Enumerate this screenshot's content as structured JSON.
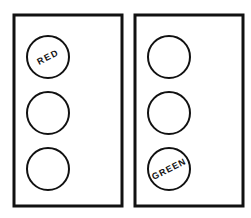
{
  "diagram": {
    "title": "Traffic Light Signal Faces",
    "background_color": "#ffffff",
    "stroke_color": "#111111",
    "fill_color": "#ffffff",
    "label_color": "#111111",
    "canvas": {
      "width": 251,
      "height": 218
    },
    "panels": [
      {
        "id": "left-signal-housing",
        "name": "left-traffic-light-housing",
        "x": 14,
        "y": 15,
        "width": 108,
        "height": 191,
        "stroke_width": 3,
        "lamps": [
          {
            "id": "left-lamp-top",
            "name": "lamp-red",
            "cx": 48,
            "cy": 57,
            "r": 21,
            "stroke_width": 2,
            "label": "RED",
            "label_rotation": -27,
            "label_font_size": 9,
            "label_letter_spacing": 1.4,
            "has_label": true
          },
          {
            "id": "left-lamp-middle",
            "name": "lamp-amber",
            "cx": 48,
            "cy": 113,
            "r": 21,
            "stroke_width": 2,
            "label": "",
            "label_rotation": 0,
            "label_font_size": 9,
            "label_letter_spacing": 1.4,
            "has_label": false
          },
          {
            "id": "left-lamp-bottom",
            "name": "lamp-green",
            "cx": 48,
            "cy": 169,
            "r": 21,
            "stroke_width": 2,
            "label": "",
            "label_rotation": 0,
            "label_font_size": 9,
            "label_letter_spacing": 1.4,
            "has_label": false
          }
        ]
      },
      {
        "id": "right-signal-housing",
        "name": "right-traffic-light-housing",
        "x": 135,
        "y": 15,
        "width": 108,
        "height": 191,
        "stroke_width": 3,
        "lamps": [
          {
            "id": "right-lamp-top",
            "name": "lamp-red",
            "cx": 169,
            "cy": 57,
            "r": 21,
            "stroke_width": 2,
            "label": "",
            "label_rotation": 0,
            "label_font_size": 9,
            "label_letter_spacing": 1.4,
            "has_label": false
          },
          {
            "id": "right-lamp-middle",
            "name": "lamp-amber",
            "cx": 169,
            "cy": 113,
            "r": 21,
            "stroke_width": 2,
            "label": "",
            "label_rotation": 0,
            "label_font_size": 9,
            "label_letter_spacing": 1.4,
            "has_label": false
          },
          {
            "id": "right-lamp-bottom",
            "name": "lamp-green",
            "cx": 169,
            "cy": 169,
            "r": 21,
            "stroke_width": 2,
            "label": "GREEN",
            "label_rotation": -27,
            "label_font_size": 9,
            "label_letter_spacing": 1.0,
            "has_label": true
          }
        ]
      }
    ]
  }
}
